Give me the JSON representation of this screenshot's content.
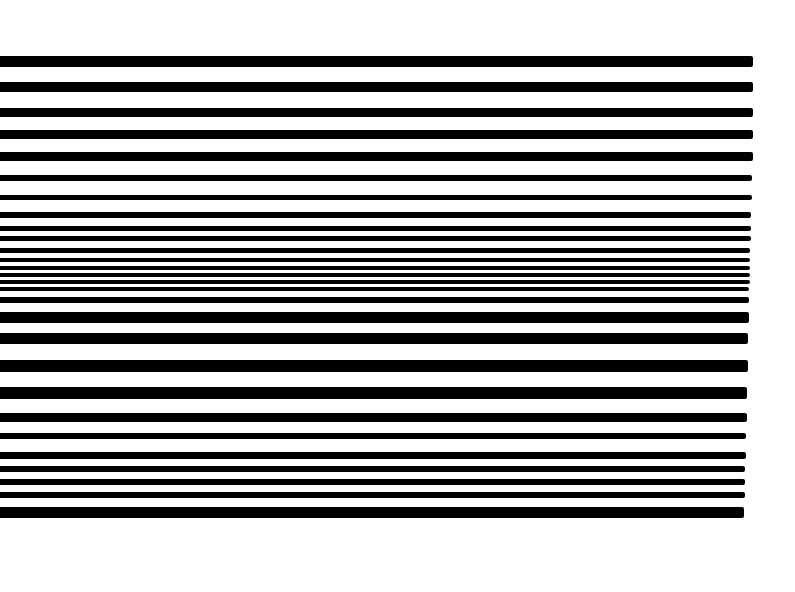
{
  "artwork": {
    "description": "Horizontal black stripes of varying thickness on white background",
    "background_color": "#ffffff",
    "bar_color": "#000000",
    "bars": [
      {
        "top": 56,
        "height": 11,
        "right": 753
      },
      {
        "top": 82,
        "height": 10,
        "right": 753
      },
      {
        "top": 108,
        "height": 9,
        "right": 753
      },
      {
        "top": 130,
        "height": 9,
        "right": 753
      },
      {
        "top": 152,
        "height": 9,
        "right": 753
      },
      {
        "top": 175,
        "height": 6,
        "right": 752
      },
      {
        "top": 195,
        "height": 5,
        "right": 752
      },
      {
        "top": 212,
        "height": 6,
        "right": 751
      },
      {
        "top": 226,
        "height": 5,
        "right": 751
      },
      {
        "top": 236,
        "height": 5,
        "right": 751
      },
      {
        "top": 248,
        "height": 5,
        "right": 750
      },
      {
        "top": 258,
        "height": 4,
        "right": 750
      },
      {
        "top": 266,
        "height": 4,
        "right": 750
      },
      {
        "top": 273,
        "height": 4,
        "right": 750
      },
      {
        "top": 280,
        "height": 4,
        "right": 750
      },
      {
        "top": 287,
        "height": 4,
        "right": 749
      },
      {
        "top": 297,
        "height": 6,
        "right": 749
      },
      {
        "top": 312,
        "height": 11,
        "right": 749
      },
      {
        "top": 333,
        "height": 11,
        "right": 748
      },
      {
        "top": 360,
        "height": 12,
        "right": 748
      },
      {
        "top": 387,
        "height": 12,
        "right": 747
      },
      {
        "top": 413,
        "height": 9,
        "right": 747
      },
      {
        "top": 433,
        "height": 6,
        "right": 746
      },
      {
        "top": 452,
        "height": 7,
        "right": 746
      },
      {
        "top": 466,
        "height": 6,
        "right": 745
      },
      {
        "top": 479,
        "height": 6,
        "right": 745
      },
      {
        "top": 492,
        "height": 6,
        "right": 745
      },
      {
        "top": 507,
        "height": 11,
        "right": 744
      }
    ]
  }
}
